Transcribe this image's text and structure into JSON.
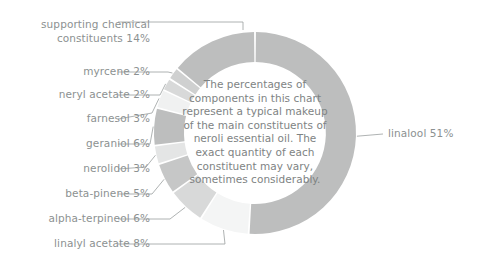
{
  "chart_data": {
    "type": "pie",
    "variant": "donut",
    "title": "",
    "center_note": "The percentages of components in this chart represent a typical makeup of the main constituents of neroli essential oil. The exact quantity of each constituent may vary, sometimes considerably.",
    "unit": "%",
    "total": 100,
    "start_angle_deg": 0,
    "direction": "clockwise",
    "legend": "none",
    "labels_position": "outside-with-leader-lines",
    "categories": [
      "linalool",
      "linalyl acetate",
      "alpha-terpineol",
      "beta-pinene",
      "nerolidol",
      "geraniol",
      "farnesol",
      "neryl acetate",
      "myrcene",
      "supporting chemical constituents"
    ],
    "values": [
      51,
      8,
      6,
      5,
      3,
      6,
      3,
      2,
      2,
      14
    ],
    "slices": [
      {
        "name": "linalool",
        "label": "linalool 51%",
        "value": 51,
        "color": "#bdbebe"
      },
      {
        "name": "linalyl-acetate",
        "label": "linalyl acetate 8%",
        "value": 8,
        "color": "#f4f5f5"
      },
      {
        "name": "alpha-terpineol",
        "label": "alpha-terpineol 6%",
        "value": 6,
        "color": "#d8d9d9"
      },
      {
        "name": "beta-pinene",
        "label": "beta-pinene 5%",
        "value": 5,
        "color": "#c6c7c7"
      },
      {
        "name": "nerolidol",
        "label": "nerolidol 3%",
        "value": 3,
        "color": "#e4e5e5"
      },
      {
        "name": "geraniol",
        "label": "geraniol 6%",
        "value": 6,
        "color": "#bdbebe"
      },
      {
        "name": "farnesol",
        "label": "farnesol 3%",
        "value": 3,
        "color": "#f0f1f1"
      },
      {
        "name": "neryl-acetate",
        "label": "neryl acetate 2%",
        "value": 2,
        "color": "#d8d9d9"
      },
      {
        "name": "myrcene",
        "label": "myrcene 2%",
        "value": 2,
        "color": "#cfd0d0"
      },
      {
        "name": "supporting-chemical-constituents",
        "label": "supporting chemical constituents 14%",
        "value": 14,
        "color": "#bdbebe"
      }
    ]
  },
  "labels": {
    "supporting": "supporting chemical constituents 14%",
    "myrcene": "myrcene 2%",
    "neryl_acetate": "neryl acetate 2%",
    "farnesol": "farnesol 3%",
    "geraniol": "geraniol 6%",
    "nerolidol": "nerolidol 3%",
    "beta_pinene": "beta-pinene 5%",
    "alpha_terpineol": "alpha-terpineol 6%",
    "linalyl_acetate": "linalyl acetate 8%",
    "linalool": "linalool 51%"
  },
  "center": {
    "text": "The percentages of components in this chart represent a typical makeup of the main constituents of neroli essential oil. The exact quantity of each constituent may vary, sometimes considerably."
  },
  "colors": {
    "text": "#8c9191",
    "center_text": "#7e8383",
    "leader_line": "#9a9f9f",
    "background": "#ffffff"
  }
}
